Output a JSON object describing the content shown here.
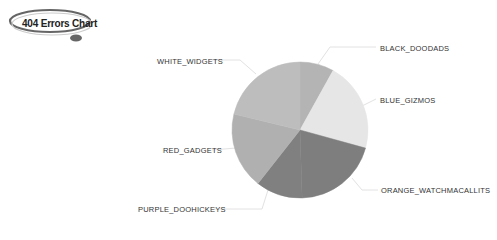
{
  "title": "404 Errors Chart",
  "chart_data": {
    "type": "pie",
    "title": "404 Errors Chart",
    "categories": [
      "BLACK_DOODADS",
      "BLUE_GIZMOS",
      "ORANGE_WATCHMACALLITS",
      "PURPLE_DOOHICKEYS",
      "RED_GADGETS",
      "WHITE_WIDGETS"
    ],
    "values": [
      8,
      21,
      20,
      11,
      18,
      21
    ],
    "colors": [
      "#b4b4b4",
      "#e6e6e6",
      "#7e7e7e",
      "#808080",
      "#b0b0b0",
      "#bdbdbd"
    ],
    "start_angle": "12 o'clock, clockwise",
    "legend": "none (leader-line labels)"
  },
  "labels": {
    "black": "BLACK_DOODADS",
    "blue": "BLUE_GIZMOS",
    "orange": "ORANGE_WATCHMACALLITS",
    "purple": "PURPLE_DOOHICKEYS",
    "red": "RED_GADGETS",
    "white": "WHITE_WIDGETS"
  }
}
